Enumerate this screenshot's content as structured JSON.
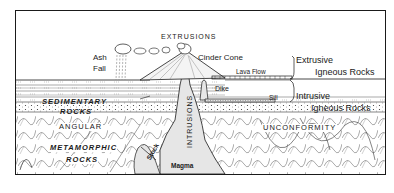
{
  "diagram": {
    "title_label": "EXTRUSIONS",
    "labels": {
      "ash_fall_line1": "Ash",
      "ash_fall_line2": "Fall",
      "cinder_cone": "Cinder Cone",
      "lava_flow": "Lava Flow",
      "dike": "Dike",
      "sill": "Sill",
      "sedimentary_line1": "SEDIMENTARY",
      "sedimentary_line2": "ROCKS",
      "angular": "ANGULAR",
      "unconformity": "UNCONFORMITY",
      "metamorphic_line1": "METAMORPHIC",
      "metamorphic_line2": "ROCKS",
      "stock": "Stock",
      "intrusions": "INTRUSIONS",
      "magma": "Magma"
    },
    "legend": {
      "extrusive_line1": "Extrusive",
      "extrusive_line2": "Igneous Rocks",
      "intrusive_line1": "Intrusive",
      "intrusive_line2": "Igneous Rocks"
    },
    "colors": {
      "ink": "#1a1a1a",
      "paper": "#ffffff",
      "magma_fill": "#e6e6e6"
    }
  }
}
